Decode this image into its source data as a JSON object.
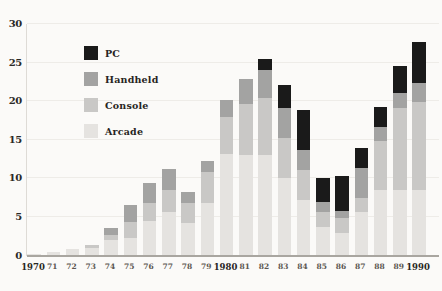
{
  "figure": {
    "background": "#fbfaf8",
    "grid_color": "#eeece8",
    "axis_color": "#a9a6a0"
  },
  "y_axis": {
    "tick_labels": [
      "0",
      "5",
      "10",
      "15",
      "20",
      "25",
      "30"
    ],
    "tick_values": [
      0,
      5,
      10,
      15,
      20,
      25,
      30
    ],
    "max": 30
  },
  "legend": {
    "items": [
      {
        "label": "PC",
        "color": "#1a1a1a"
      },
      {
        "label": "Handheld",
        "color": "#a3a3a2"
      },
      {
        "label": "Console",
        "color": "#c9c8c6"
      },
      {
        "label": "Arcade",
        "color": "#e5e3e0"
      }
    ]
  },
  "chart_data": {
    "type": "bar",
    "stacked": true,
    "title": "",
    "xlabel": "",
    "ylabel": "",
    "ylim": [
      0,
      30
    ],
    "grid": true,
    "legend_position": "upper-left-inside",
    "categories": [
      "1970",
      "71",
      "72",
      "73",
      "74",
      "75",
      "76",
      "77",
      "78",
      "79",
      "1980",
      "81",
      "82",
      "83",
      "84",
      "85",
      "86",
      "87",
      "88",
      "89",
      "1990"
    ],
    "emphasized_categories": [
      "1970",
      "1980",
      "1990"
    ],
    "series": [
      {
        "name": "PC",
        "color": "#1a1a1a",
        "values": [
          0,
          0,
          0,
          0,
          0,
          0,
          0,
          0,
          0,
          0,
          0,
          0,
          1.5,
          3.0,
          5.1,
          3.2,
          4.5,
          2.6,
          2.7,
          3.5,
          5.3
        ]
      },
      {
        "name": "Handheld",
        "color": "#a3a3a2",
        "values": [
          0,
          0,
          0,
          0,
          1.0,
          2.2,
          2.6,
          2.7,
          1.4,
          1.5,
          2.2,
          3.2,
          3.6,
          3.9,
          2.6,
          1.3,
          1.0,
          3.9,
          1.8,
          2.0,
          2.5
        ]
      },
      {
        "name": "Console",
        "color": "#c9c8c6",
        "values": [
          0,
          0,
          0.1,
          0.3,
          0.6,
          2.0,
          2.3,
          2.9,
          2.6,
          4.0,
          4.7,
          6.7,
          7.4,
          5.2,
          3.9,
          1.9,
          1.9,
          1.8,
          6.3,
          10.6,
          11.4
        ]
      },
      {
        "name": "Arcade",
        "color": "#e5e3e0",
        "values": [
          0.2,
          0.4,
          0.8,
          1.0,
          2.0,
          2.3,
          4.5,
          5.6,
          4.2,
          6.8,
          13.2,
          13.0,
          13.0,
          10.0,
          7.2,
          3.7,
          2.9,
          5.6,
          8.5,
          8.5,
          8.5
        ]
      }
    ]
  }
}
